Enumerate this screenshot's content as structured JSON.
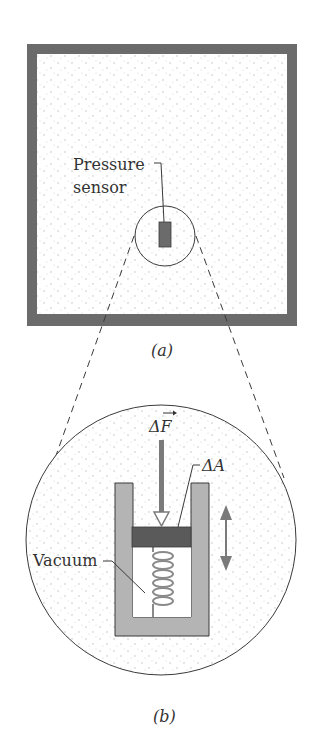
{
  "figure": {
    "panel_a": {
      "caption": "(a)",
      "sensor_label_line1": "Pressure",
      "sensor_label_line2": "sensor"
    },
    "panel_b": {
      "caption": "(b)",
      "force_label": "ΔF",
      "area_label": "ΔA",
      "vacuum_label": "Vacuum"
    },
    "colors": {
      "wall": "#6b6b6b",
      "container": "#b4b4b4",
      "piston": "#5a5a5a",
      "arrow": "#7a7a7a",
      "line": "#3a3a3a",
      "fluid_dots": "#c8c8c8"
    }
  }
}
